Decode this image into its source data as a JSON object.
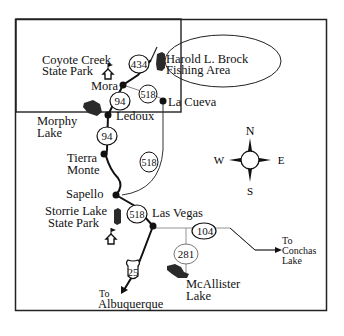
{
  "map": {
    "title_region": "Northern New Mexico – Mora / Las Vegas area",
    "places": {
      "coyote_creek": "Coyote Creek",
      "coyote_creek_2": "State Park",
      "harold": "Harold L. Brock",
      "harold_2": "Fishing Area",
      "mora": "Mora",
      "la_cueva": "La Cueva",
      "morphy": "Morphy",
      "morphy_2": "Lake",
      "ledoux": "Ledoux",
      "tierra": "Tierra",
      "tierra_2": "Monte",
      "sapello": "Sapello",
      "storrie": "Storrie Lake",
      "storrie_2": "State Park",
      "las_vegas": "Las Vegas",
      "mcallister": "McAllister",
      "mcallister_2": "Lake",
      "to_albuquerque": "To",
      "to_albuquerque_2": "Albuquerque",
      "to_conchas": "To",
      "to_conchas_2": "Conchas",
      "to_conchas_3": "Lake"
    },
    "routes": {
      "r434": "434",
      "r518a": "518",
      "r94a": "94",
      "r94b": "94",
      "r518b": "518",
      "r518c": "518",
      "r104": "104",
      "r281": "281",
      "i25": "25"
    },
    "compass": {
      "n": "N",
      "s": "S",
      "e": "E",
      "w": "W"
    },
    "colors": {
      "line": "#111111",
      "lake": "#2a2a2a",
      "minor_road": "#999999",
      "background": "#ffffff"
    }
  }
}
